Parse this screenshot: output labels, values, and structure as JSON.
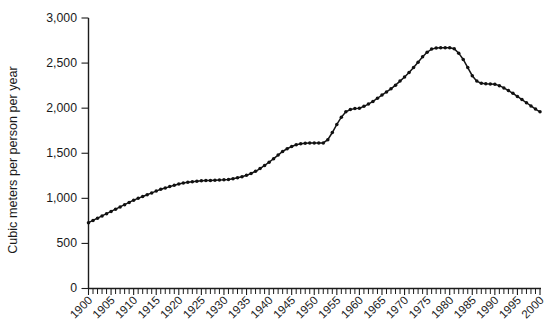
{
  "chart_data": {
    "type": "line",
    "title": "",
    "subtitle": "",
    "xlabel": "",
    "ylabel": "Cubic meters per person per year",
    "xlim": [
      1900,
      2000
    ],
    "ylim": [
      0,
      3000
    ],
    "grid": false,
    "legend": null,
    "legend_position": "none",
    "y_ticks": [
      0,
      500,
      1000,
      1500,
      2000,
      2500,
      3000
    ],
    "y_tick_labels": [
      "0",
      "500",
      "1,000",
      "1,500",
      "2,000",
      "2,500",
      "3,000"
    ],
    "x_ticks": [
      1900,
      1905,
      1910,
      1915,
      1920,
      1925,
      1930,
      1935,
      1940,
      1945,
      1950,
      1955,
      1960,
      1965,
      1970,
      1975,
      1980,
      1985,
      1990,
      1995,
      2000
    ],
    "x_tick_labels": [
      "1900",
      "1905",
      "1910",
      "1915",
      "1920",
      "1925",
      "1930",
      "1935",
      "1940",
      "1945",
      "1950",
      "1955",
      "1960",
      "1965",
      "1970",
      "1975",
      "1980",
      "1985",
      "1990",
      "1995",
      "2000"
    ],
    "x_minor_tick_step": 1,
    "marker": "circle",
    "line_color": "#141414",
    "series": [
      {
        "name": "Water withdrawal per person",
        "x": [
          1900,
          1901,
          1902,
          1903,
          1904,
          1905,
          1906,
          1907,
          1908,
          1909,
          1910,
          1911,
          1912,
          1913,
          1914,
          1915,
          1916,
          1917,
          1918,
          1919,
          1920,
          1921,
          1922,
          1923,
          1924,
          1925,
          1926,
          1927,
          1928,
          1929,
          1930,
          1931,
          1932,
          1933,
          1934,
          1935,
          1936,
          1937,
          1938,
          1939,
          1940,
          1941,
          1942,
          1943,
          1944,
          1945,
          1946,
          1947,
          1948,
          1949,
          1950,
          1951,
          1952,
          1953,
          1954,
          1955,
          1956,
          1957,
          1958,
          1959,
          1960,
          1961,
          1962,
          1963,
          1964,
          1965,
          1966,
          1967,
          1968,
          1969,
          1970,
          1971,
          1972,
          1973,
          1974,
          1975,
          1976,
          1977,
          1978,
          1979,
          1980,
          1981,
          1982,
          1983,
          1984,
          1985,
          1986,
          1987,
          1988,
          1989,
          1990,
          1991,
          1992,
          1993,
          1994,
          1995,
          1996,
          1997,
          1998,
          1999,
          2000
        ],
        "values": [
          730,
          755,
          780,
          805,
          830,
          855,
          880,
          905,
          930,
          955,
          980,
          1000,
          1020,
          1040,
          1060,
          1080,
          1100,
          1115,
          1130,
          1145,
          1160,
          1170,
          1178,
          1184,
          1190,
          1195,
          1197,
          1199,
          1200,
          1202,
          1205,
          1210,
          1218,
          1228,
          1240,
          1255,
          1275,
          1300,
          1330,
          1365,
          1400,
          1440,
          1480,
          1520,
          1550,
          1575,
          1595,
          1605,
          1612,
          1615,
          1615,
          1614,
          1614,
          1650,
          1730,
          1820,
          1900,
          1960,
          1985,
          1995,
          2000,
          2020,
          2045,
          2075,
          2110,
          2145,
          2180,
          2215,
          2255,
          2300,
          2345,
          2395,
          2450,
          2510,
          2570,
          2620,
          2655,
          2668,
          2670,
          2670,
          2670,
          2660,
          2610,
          2540,
          2450,
          2360,
          2300,
          2275,
          2270,
          2268,
          2265,
          2250,
          2225,
          2195,
          2165,
          2130,
          2095,
          2060,
          2025,
          1990,
          1960
        ]
      }
    ]
  }
}
